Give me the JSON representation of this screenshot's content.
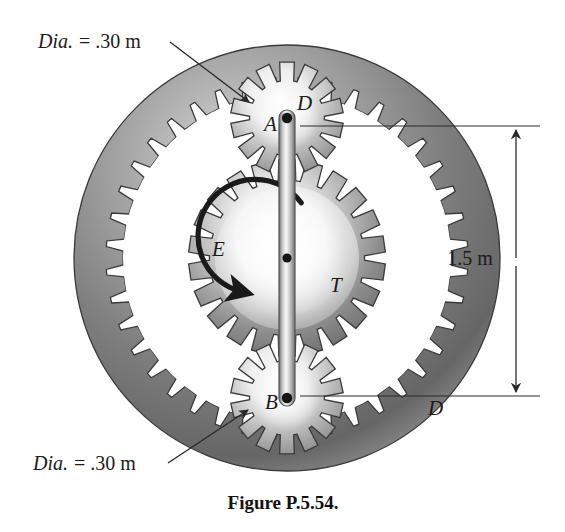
{
  "figure": {
    "caption": "Figure P.5.54.",
    "background_color": "#ffffff",
    "ink_color": "#1b1b1b",
    "metal_gray": "#808080",
    "metal_light": "#f2f2f2",
    "metal_dark": "#4a4a4a"
  },
  "annotations": {
    "top_diameter": {
      "italic_part": "Dia.",
      "upright_part": "= .30 m",
      "full": "Dia. = .30 m",
      "x": 38,
      "y": 48,
      "points_to": "gear-a"
    },
    "bottom_diameter": {
      "italic_part": "Dia.",
      "upright_part": "= .30 m",
      "full": "Dia. = .30 m",
      "x": 33,
      "y": 470,
      "points_to": "gear-b"
    }
  },
  "dimension": {
    "label": "1.5 m",
    "x": 470,
    "y": 265,
    "from_y": 126,
    "to_y": 396,
    "line_x": 516,
    "arrow_style": "double-headed"
  },
  "gear_labels": {
    "a": {
      "text": "A",
      "x": 264,
      "y": 131
    },
    "b": {
      "text": "B",
      "x": 265,
      "y": 409
    },
    "e": {
      "text": "E",
      "x": 212,
      "y": 256
    },
    "t": {
      "text": "T",
      "x": 330,
      "y": 292
    },
    "d_top": {
      "text": "D",
      "x": 297,
      "y": 110
    },
    "d_bottom": {
      "text": "D",
      "x": 428,
      "y": 415
    }
  },
  "geometry": {
    "center": {
      "x": 287,
      "y": 258
    },
    "ring_outer_radius": 213,
    "ring_inner_root_radius": 181,
    "ring_tooth_depth": 17,
    "ring_teeth": 40,
    "sun_pitch_radius": 87,
    "sun_teeth": 22,
    "planet_pitch_radius": 46,
    "planet_teeth": 14,
    "pin_a": {
      "x": 287,
      "y": 118
    },
    "pin_b": {
      "x": 287,
      "y": 398
    },
    "link_half_width": 8
  },
  "torque_arrow": {
    "direction": "counterclockwise",
    "radius": 57,
    "label": "T"
  }
}
